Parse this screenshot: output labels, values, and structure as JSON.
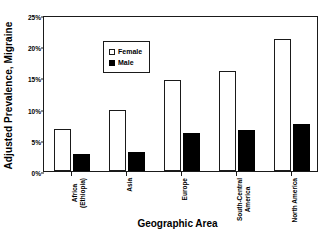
{
  "chart_data": {
    "type": "bar",
    "title": "",
    "xlabel": "Geographic Area",
    "ylabel": "Adjusted Prevalence, Migraine",
    "categories": [
      "Africa (Ethiopia)",
      "Asia",
      "Europe",
      "South-Central America",
      "North America"
    ],
    "category_lines": [
      [
        "Africa",
        "(Ethiopia)"
      ],
      [
        "Asia",
        ""
      ],
      [
        "Europe",
        ""
      ],
      [
        "South-Central",
        "America"
      ],
      [
        "North America",
        ""
      ]
    ],
    "series": [
      {
        "name": "Female",
        "values": [
          6.7,
          9.8,
          14.6,
          16.0,
          21.2
        ],
        "color": "#ffffff",
        "edge": "#1a1a1a"
      },
      {
        "name": "Male",
        "values": [
          2.7,
          3.0,
          6.1,
          6.6,
          7.5
        ],
        "color": "#000000",
        "edge": "#000000"
      }
    ],
    "ylim": [
      0,
      25
    ],
    "yticks": [
      0,
      5,
      10,
      15,
      20,
      25
    ],
    "ytick_labels": [
      "0%",
      "5%",
      "10%",
      "15%",
      "20%",
      "25%"
    ],
    "grid": false,
    "legend_position": "top-left",
    "units": "percent"
  },
  "legend": {
    "items": [
      {
        "label": "Female",
        "marker": "open-square"
      },
      {
        "label": "Male",
        "marker": "filled-square"
      }
    ]
  }
}
